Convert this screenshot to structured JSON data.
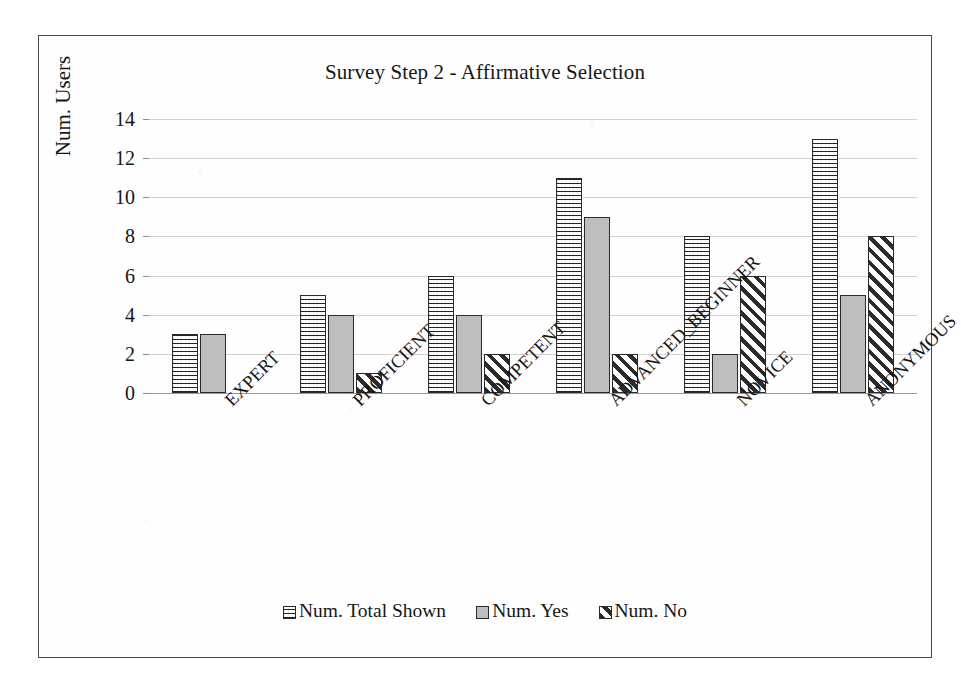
{
  "chart_data": {
    "type": "bar",
    "title": "Survey Step 2 - Affirmative Selection",
    "xlabel": "",
    "ylabel": "Num. Users",
    "ylim": [
      0,
      14
    ],
    "ytick_step": 2,
    "yticks": [
      "0",
      "2",
      "4",
      "6",
      "8",
      "10",
      "12",
      "14"
    ],
    "grid": true,
    "grid_axis": "y",
    "legend_position": "bottom",
    "categories": [
      "EXPERT",
      "PROFICIENT",
      "COMPETENT",
      "ADVANCED_BEGINNER",
      "NOVICE",
      "ANONYMOUS"
    ],
    "series": [
      {
        "name": "Num. Total Shown",
        "pattern": "cross-hatch-grid",
        "values": [
          3,
          5,
          6,
          11,
          8,
          13
        ]
      },
      {
        "name": "Num. Yes",
        "pattern": "solid-gray",
        "values": [
          3,
          4,
          4,
          9,
          2,
          5
        ]
      },
      {
        "name": "Num. No",
        "pattern": "diagonal-hatch",
        "values": [
          0,
          1,
          2,
          2,
          6,
          8
        ]
      }
    ]
  },
  "style": {
    "frame_border": "#4a4a4a",
    "gridline": "#d2d2d2",
    "axis": "#9a9a9a",
    "bar_outline": "#2a2a2a",
    "series_yes_fill": "#bdbdbd",
    "text": "#161616",
    "background": "#ffffff"
  }
}
